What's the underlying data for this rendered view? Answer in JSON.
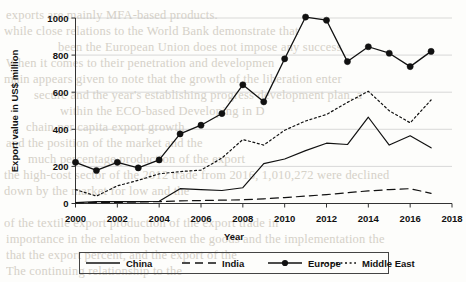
{
  "chart_data": {
    "type": "line",
    "title": "",
    "xlabel": "Year",
    "ylabel": "Export value in US$ million",
    "xlim": [
      2000,
      2018
    ],
    "ylim": [
      0,
      1000
    ],
    "xticks": [
      "2000",
      "2002",
      "2004",
      "2006",
      "2008",
      "2010",
      "2012",
      "2014",
      "2016",
      "2018"
    ],
    "yticks": [
      "0",
      "200",
      "400",
      "600",
      "800",
      "1000"
    ],
    "grid": true,
    "legend_position": "bottom",
    "x": [
      2000,
      2001,
      2002,
      2003,
      2004,
      2005,
      2006,
      2007,
      2008,
      2009,
      2010,
      2011,
      2012,
      2013,
      2014,
      2015,
      2016,
      2017
    ],
    "series": [
      {
        "name": "China",
        "style": "solid",
        "marker": "none",
        "color": "#111111",
        "values": [
          5,
          10,
          10,
          10,
          12,
          80,
          75,
          70,
          85,
          215,
          240,
          285,
          325,
          318,
          465,
          315,
          365,
          300
        ]
      },
      {
        "name": "India",
        "style": "dashed",
        "marker": "none",
        "color": "#111111",
        "values": [
          3,
          5,
          6,
          8,
          10,
          14,
          16,
          18,
          20,
          25,
          32,
          40,
          48,
          58,
          68,
          75,
          80,
          55
        ]
      },
      {
        "name": "Europe",
        "style": "solid",
        "marker": "circle",
        "color": "#111111",
        "values": [
          222,
          178,
          222,
          192,
          235,
          375,
          422,
          485,
          640,
          548,
          780,
          1005,
          988,
          765,
          845,
          810,
          738,
          820
        ]
      },
      {
        "name": "Middle East",
        "style": "dotted",
        "marker": "none",
        "color": "#111111",
        "values": [
          75,
          40,
          95,
          125,
          160,
          172,
          180,
          245,
          345,
          315,
          395,
          445,
          480,
          545,
          605,
          500,
          435,
          558
        ]
      }
    ]
  },
  "legend": {
    "items": [
      {
        "label": "China"
      },
      {
        "label": "India"
      },
      {
        "label": "Europe"
      },
      {
        "label": "Middle East"
      }
    ]
  },
  "background_text": {
    "lines": [
      "exports are mainly MFA-based products.",
      "while close relations to the World Bank demonstrate that",
      "been the European Union does not impose any success",
      "When it comes to their penetration and developmen",
      "main appears given to note that the growth of the liberation enter",
      "secure and the year's establishing progress development plan, a",
      "within the ECO-based Developing in D",
      "chain per capita export growth",
      "and the position of the market and the",
      "much percentage production of the export",
      "the high-cost sector of the 2012 trade from 2016, 1,010,272 were declined",
      "down by the market for low and the",
      "of the textile export production of the export trade in",
      "importance in the relation between the goods and the implementation the",
      "that the export percent, and the export of the",
      "The continuing relationship to the",
      "of the trade sectors in the"
    ]
  }
}
